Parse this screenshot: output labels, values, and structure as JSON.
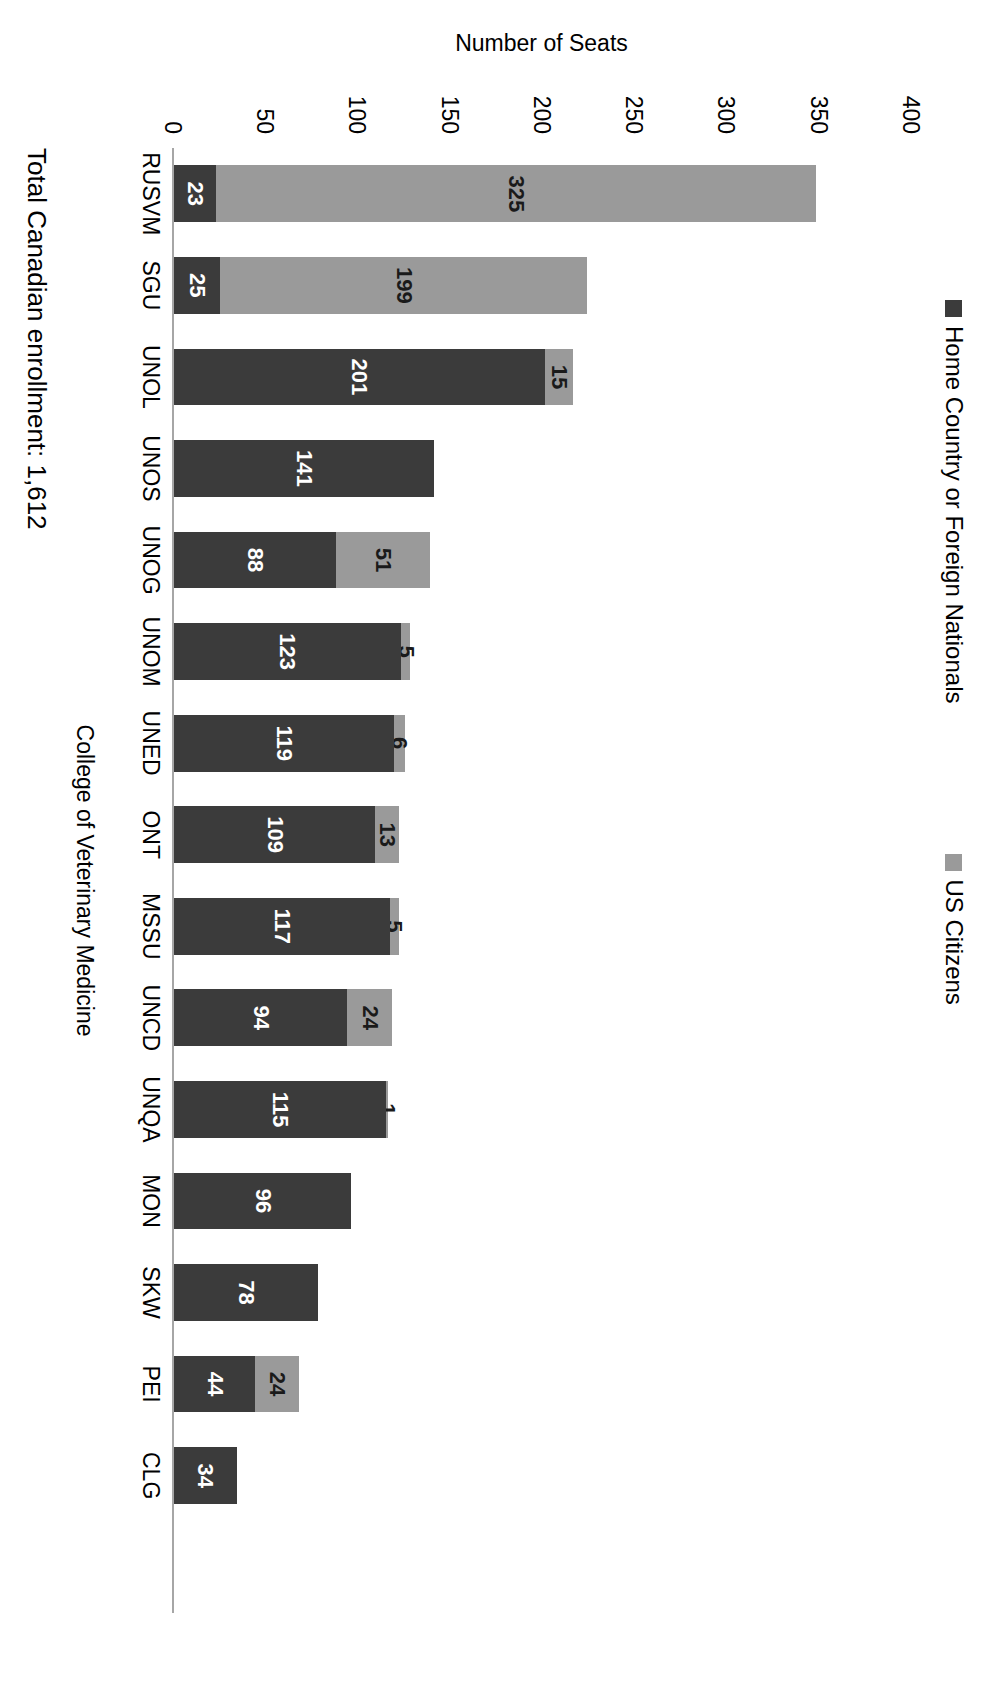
{
  "chart_data": {
    "type": "bar",
    "subtype": "stacked-vertical-bar",
    "title": "",
    "xlabel": "College of Veterinary Medicine",
    "ylabel": "Number of Seats",
    "ylim": [
      0,
      400
    ],
    "yticks": [
      400,
      350,
      300,
      250,
      200,
      150,
      100,
      50,
      0
    ],
    "grid": false,
    "legend_position": "top",
    "categories": [
      "RUSVM",
      "SGU",
      "UNOL",
      "UNOS",
      "UNOG",
      "UNOM",
      "UNED",
      "ONT",
      "MSSU",
      "UNCD",
      "UNQA",
      "MON",
      "SKW",
      "PEI",
      "CLG",
      ""
    ],
    "series": [
      {
        "name": "Home Country or Foreign Nationals",
        "color": "#3b3b3b",
        "values": [
          23,
          25,
          201,
          141,
          88,
          123,
          119,
          109,
          117,
          94,
          115,
          96,
          78,
          44,
          34,
          null
        ]
      },
      {
        "name": "US Citizens",
        "color": "#9a9a9a",
        "values": [
          325,
          199,
          15,
          null,
          51,
          5,
          6,
          13,
          5,
          24,
          1,
          null,
          null,
          24,
          null,
          null
        ]
      }
    ],
    "annotations": [
      {
        "text": "Total Canadian enrollment: 1,612"
      }
    ]
  },
  "legend": {
    "entries": [
      {
        "label": "Home Country or Foreign Nationals",
        "color": "#3b3b3b"
      },
      {
        "label": "US Citizens",
        "color": "#9a9a9a"
      }
    ]
  },
  "axes": {
    "y": {
      "label": "Number of Seats",
      "ticks": [
        "400",
        "350",
        "300",
        "250",
        "200",
        "150",
        "100",
        "50",
        "0"
      ]
    },
    "x": {
      "label": "College of Veterinary Medicine"
    }
  },
  "caption": {
    "text": "Total Canadian enrollment: 1,612"
  }
}
